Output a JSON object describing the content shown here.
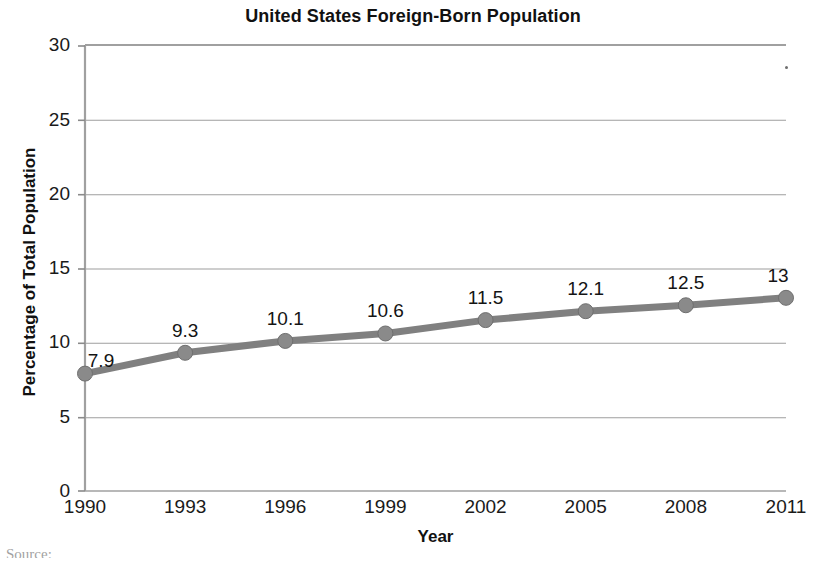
{
  "chart_data": {
    "type": "line",
    "title": "United States Foreign-Born Population",
    "xlabel": "Year",
    "ylabel": "Percentage of Total Population",
    "categories": [
      "1990",
      "1993",
      "1996",
      "1999",
      "2002",
      "2005",
      "2008",
      "2011"
    ],
    "values": [
      7.9,
      9.3,
      10.1,
      10.6,
      11.5,
      12.1,
      12.5,
      13
    ],
    "point_labels": [
      "7.9",
      "9.3",
      "10.1",
      "10.6",
      "11.5",
      "12.1",
      "12.5",
      "13"
    ],
    "ylim": [
      0,
      30
    ],
    "y_ticks": [
      "0",
      "5",
      "10",
      "15",
      "20",
      "25",
      "30"
    ],
    "y_tick_values": [
      0,
      5,
      10,
      15,
      20,
      25,
      30
    ],
    "grid": "horizontal",
    "legend": "none",
    "series_color": "#808080",
    "marker_color": "#8a8a8a",
    "axis_color": "#999999",
    "text_color": "#1a1a1a"
  },
  "footer": {
    "source_text": "Source:"
  }
}
